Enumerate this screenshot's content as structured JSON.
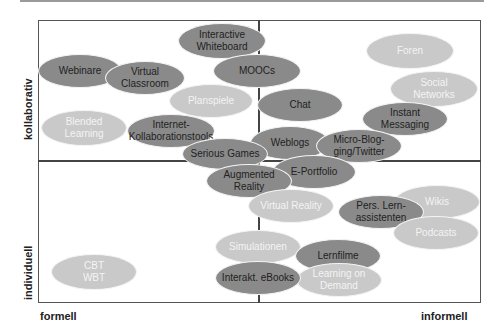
{
  "axes": {
    "y_top": "kollaborativ",
    "y_bottom": "individuell",
    "x_left": "formell",
    "x_right": "informell"
  },
  "nodes": [
    {
      "id": "interactive-whiteboard",
      "label": "Interactive\nWhiteboard",
      "cx": 222,
      "cy": 41,
      "w": 88,
      "h": 36,
      "tone": "dark"
    },
    {
      "id": "foren",
      "label": "Foren",
      "cx": 410,
      "cy": 51,
      "w": 88,
      "h": 36,
      "tone": "light"
    },
    {
      "id": "webinare",
      "label": "Webinare",
      "cx": 80,
      "cy": 71,
      "w": 84,
      "h": 34,
      "tone": "dark"
    },
    {
      "id": "virtual-classroom",
      "label": "Virtual\nClassroom",
      "cx": 145,
      "cy": 78,
      "w": 80,
      "h": 34,
      "tone": "dark"
    },
    {
      "id": "moocs",
      "label": "MOOCs",
      "cx": 257,
      "cy": 71,
      "w": 88,
      "h": 34,
      "tone": "dark"
    },
    {
      "id": "social-networks",
      "label": "Social\nNetworks",
      "cx": 434,
      "cy": 89,
      "w": 88,
      "h": 36,
      "tone": "light"
    },
    {
      "id": "planspiele",
      "label": "Planspiele",
      "cx": 211,
      "cy": 101,
      "w": 84,
      "h": 34,
      "tone": "light"
    },
    {
      "id": "chat",
      "label": "Chat",
      "cx": 300,
      "cy": 105,
      "w": 86,
      "h": 34,
      "tone": "dark"
    },
    {
      "id": "instant-messaging",
      "label": "Instant\nMessaging",
      "cx": 405,
      "cy": 119,
      "w": 86,
      "h": 34,
      "tone": "dark"
    },
    {
      "id": "blended-learning",
      "label": "Blended\nLearning",
      "cx": 84,
      "cy": 128,
      "w": 86,
      "h": 36,
      "tone": "light"
    },
    {
      "id": "internet-kollaborationstools",
      "label": "Internet-\nKollaborationstools",
      "cx": 171,
      "cy": 131,
      "w": 88,
      "h": 34,
      "tone": "dark"
    },
    {
      "id": "weblogs",
      "label": "Weblogs",
      "cx": 290,
      "cy": 143,
      "w": 80,
      "h": 34,
      "tone": "dark"
    },
    {
      "id": "micro-blogging",
      "label": "Micro-Blog-\nging/Twitter",
      "cx": 359,
      "cy": 146,
      "w": 86,
      "h": 34,
      "tone": "dark"
    },
    {
      "id": "serious-games",
      "label": "Serious Games",
      "cx": 225,
      "cy": 154,
      "w": 86,
      "h": 32,
      "tone": "dark"
    },
    {
      "id": "e-portfolio",
      "label": "E-Portfolio",
      "cx": 314,
      "cy": 172,
      "w": 84,
      "h": 34,
      "tone": "dark"
    },
    {
      "id": "augmented-reality",
      "label": "Augmented\nReality",
      "cx": 249,
      "cy": 181,
      "w": 86,
      "h": 34,
      "tone": "dark"
    },
    {
      "id": "wikis",
      "label": "Wikis",
      "cx": 437,
      "cy": 202,
      "w": 86,
      "h": 34,
      "tone": "light"
    },
    {
      "id": "virtual-reality",
      "label": "Virtual Reality",
      "cx": 291,
      "cy": 206,
      "w": 86,
      "h": 34,
      "tone": "light"
    },
    {
      "id": "pers-lernassistenten",
      "label": "Pers. Lern-\nassistenten",
      "cx": 381,
      "cy": 212,
      "w": 86,
      "h": 34,
      "tone": "dark"
    },
    {
      "id": "podcasts",
      "label": "Podcasts",
      "cx": 436,
      "cy": 233,
      "w": 86,
      "h": 34,
      "tone": "light"
    },
    {
      "id": "simulationen",
      "label": "Simulationen",
      "cx": 258,
      "cy": 247,
      "w": 86,
      "h": 34,
      "tone": "light"
    },
    {
      "id": "lernfilme",
      "label": "Lernfilme",
      "cx": 338,
      "cy": 256,
      "w": 86,
      "h": 34,
      "tone": "dark"
    },
    {
      "id": "cbt-wbt",
      "label": "CBT\nWBT",
      "cx": 94,
      "cy": 272,
      "w": 86,
      "h": 36,
      "tone": "light"
    },
    {
      "id": "learning-on-demand",
      "label": "Learning on\nDemand",
      "cx": 339,
      "cy": 280,
      "w": 86,
      "h": 34,
      "tone": "light"
    },
    {
      "id": "interakt-ebooks",
      "label": "Interakt. eBooks",
      "cx": 258,
      "cy": 278,
      "w": 86,
      "h": 34,
      "tone": "dark"
    }
  ],
  "colors": {
    "dark": "#8a8a8a",
    "light": "#c9c9c9"
  }
}
